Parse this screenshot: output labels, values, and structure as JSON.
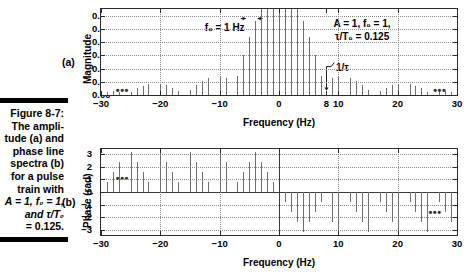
{
  "caption": {
    "figure_number": "Figure 8-7:",
    "lines": [
      "The ampli-",
      "tude (a) and",
      "phase line",
      "spectra (b)",
      "for a pulse",
      "train with",
      "A = 1, f₀ = 1,",
      "and τ/T₀",
      "= 0.125."
    ]
  },
  "panel_a": {
    "letter": "(a)",
    "ylabel": "Magnitude",
    "xlabel": "Frequency (Hz)",
    "annotation_f0": "f₀ = 1 Hz",
    "annotation_params_line1": "A = 1, f₀ = 1,",
    "annotation_params_line2": "τ/T₀ = 0.125",
    "annotation_tau": "1/τ",
    "ellipsis_left": "•••",
    "ellipsis_right": "•••"
  },
  "panel_b": {
    "letter": "(b)",
    "ylabel": "Phase (rad)",
    "xlabel": "Frequency (Hz)",
    "ellipsis_left": "•••",
    "ellipsis_right": "•••"
  },
  "colors": {
    "stem": "#6f6f6f",
    "axis": "#2b2b2b",
    "grid": "#8c8c8c",
    "text": "#000000",
    "rule": "#000000"
  },
  "chart_data": [
    {
      "type": "bar",
      "id": "magnitude-spectrum",
      "title": "",
      "xlabel": "Frequency (Hz)",
      "ylabel": "Magnitude",
      "xlim": [
        -30,
        30
      ],
      "ylim": [
        0.0,
        0.13
      ],
      "grid": true,
      "xticks": [
        -30,
        -20,
        -10,
        0,
        8,
        10,
        20,
        30
      ],
      "yticks": [
        0.0,
        0.02,
        0.04,
        0.06,
        0.08,
        0.1,
        0.12
      ],
      "ytick_labels": [
        "0.00",
        "0.02",
        "0.04",
        "0.06",
        "0.08",
        "0.10",
        "0.12"
      ],
      "description": "Magnitude line spectrum of a rectangular pulse train, |c_n| = (A*tau/T0)*|sinc(n*f0*tau)| with A=1, f0=1 Hz, tau/T0=0.125; nulls at multiples of 8 Hz.",
      "x": [
        -29,
        -28,
        -27,
        -26,
        -25,
        -24,
        -23,
        -22,
        -21,
        -20,
        -19,
        -18,
        -17,
        -16,
        -15,
        -14,
        -13,
        -12,
        -11,
        -10,
        -9,
        -8,
        -7,
        -6,
        -5,
        -4,
        -3,
        -2,
        -1,
        0,
        1,
        2,
        3,
        4,
        5,
        6,
        7,
        8,
        9,
        10,
        11,
        12,
        13,
        14,
        15,
        16,
        17,
        18,
        19,
        20,
        21,
        22,
        23,
        24,
        25,
        26,
        27,
        28,
        29
      ],
      "values": [
        0.0043,
        0.0057,
        0.0046,
        0.0,
        0.0052,
        0.0099,
        0.0138,
        0.0161,
        0.0,
        0.017,
        0.0148,
        0.0112,
        0.0063,
        0.0,
        0.0074,
        0.0145,
        0.0207,
        0.025,
        0.0,
        0.0276,
        0.025,
        0.0,
        0.0293,
        0.0601,
        0.0884,
        0.1125,
        0.1306,
        0.1419,
        0.1457,
        0.125,
        0.1457,
        0.1419,
        0.1306,
        0.1125,
        0.0884,
        0.0601,
        0.0293,
        0.0,
        0.025,
        0.0276,
        0.0,
        0.025,
        0.0207,
        0.0145,
        0.0074,
        0.0,
        0.0063,
        0.0112,
        0.0148,
        0.017,
        0.0,
        0.0161,
        0.0138,
        0.0099,
        0.0052,
        0.0,
        0.0046,
        0.0057,
        0.0043
      ],
      "annotations": [
        "f₀ = 1 Hz",
        "A = 1, f₀ = 1,",
        "τ/T₀ = 0.125",
        "1/τ"
      ]
    },
    {
      "type": "bar",
      "id": "phase-spectrum",
      "title": "",
      "xlabel": "Frequency (Hz)",
      "ylabel": "Phase (rad)",
      "xlim": [
        -30,
        30
      ],
      "ylim": [
        -3.4,
        3.4
      ],
      "grid": true,
      "xticks": [
        -30,
        -20,
        -10,
        0,
        10,
        20,
        30
      ],
      "yticks": [
        -3,
        -2,
        -1,
        0,
        1,
        2,
        3
      ],
      "ytick_labels": [
        "−3",
        "−2",
        "−1",
        "0",
        "1",
        "2",
        "3"
      ],
      "description": "Phase line spectrum of the same pulse train; positive values on negative frequencies, negative values on positive frequencies, wrapped to (−π, π].",
      "x": [
        -29,
        -28,
        -27,
        -26,
        -25,
        -24,
        -23,
        -22,
        -21,
        -20,
        -19,
        -18,
        -17,
        -16,
        -15,
        -14,
        -13,
        -12,
        -11,
        -10,
        -9,
        -8,
        -7,
        -6,
        -5,
        -4,
        -3,
        -2,
        -1,
        0,
        1,
        2,
        3,
        4,
        5,
        6,
        7,
        8,
        9,
        10,
        11,
        12,
        13,
        14,
        15,
        16,
        17,
        18,
        19,
        20,
        21,
        22,
        23,
        24,
        25,
        26,
        27,
        28,
        29
      ],
      "values": [
        0.79,
        1.57,
        2.36,
        0.0,
        3.14,
        2.36,
        1.57,
        0.79,
        0.0,
        3.14,
        2.36,
        1.57,
        0.79,
        0.0,
        3.14,
        2.36,
        1.57,
        0.79,
        0.0,
        3.14,
        2.36,
        0.0,
        0.79,
        1.57,
        2.36,
        3.14,
        2.36,
        1.57,
        0.79,
        0.0,
        -0.79,
        -1.57,
        -2.36,
        -3.14,
        -2.36,
        -1.57,
        -0.79,
        0.0,
        -2.36,
        -3.14,
        0.0,
        -0.79,
        -1.57,
        -2.36,
        -3.14,
        0.0,
        -0.79,
        -1.57,
        -2.36,
        -3.14,
        0.0,
        -0.79,
        -1.57,
        -2.36,
        -3.14,
        0.0,
        -0.79,
        -1.57,
        -2.36
      ]
    }
  ]
}
